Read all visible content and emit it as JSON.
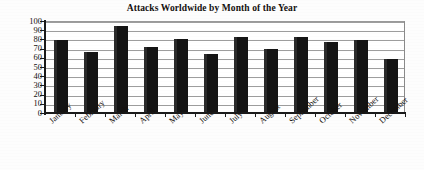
{
  "chart_data": {
    "type": "bar",
    "title": "Attacks Worldwide by Month of the Year",
    "xlabel": "",
    "ylabel": "",
    "categories": [
      "January",
      "February",
      "March",
      "April",
      "May",
      "June",
      "July",
      "August",
      "September",
      "October",
      "November",
      "December"
    ],
    "values": [
      78,
      65,
      94,
      71,
      79,
      63,
      81,
      69,
      82,
      76,
      78,
      58
    ],
    "ylim": [
      0,
      100
    ],
    "ytick_labels": [
      "100",
      "90",
      "80",
      "70",
      "60",
      "50",
      "40",
      "30",
      "20",
      "10",
      "0"
    ],
    "ytick_values": [
      100,
      90,
      80,
      70,
      60,
      50,
      40,
      30,
      20,
      10,
      0
    ],
    "grid": true,
    "grid_axis": "y",
    "legend": false,
    "legend_position": "none",
    "bar_color": "#141414",
    "axis_color": "#1a1a1a",
    "grid_color": "#9d9d9d",
    "background_color": "#ffffff",
    "label_rotation": -42
  }
}
